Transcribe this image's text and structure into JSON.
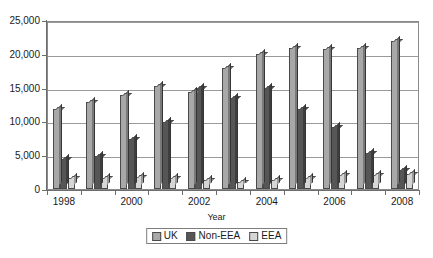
{
  "chart_data": {
    "type": "bar",
    "title": "",
    "xlabel": "Year",
    "ylabel": "",
    "categories": [
      "1998",
      "1999",
      "2000",
      "2001",
      "2002",
      "2003",
      "2004",
      "2005",
      "2006",
      "2007",
      "2008"
    ],
    "series": [
      {
        "name": "UK",
        "color": "#a8a8a8",
        "values": [
          11800,
          12800,
          13900,
          15200,
          14300,
          17900,
          19900,
          20900,
          20700,
          20900,
          21900
        ]
      },
      {
        "name": "Non-EEA",
        "color": "#565656",
        "values": [
          4400,
          4900,
          7400,
          9900,
          15000,
          13500,
          15000,
          11900,
          9100,
          5300,
          2800
        ]
      },
      {
        "name": "EEA",
        "color": "#d6d6d6",
        "values": [
          1700,
          1700,
          1800,
          1600,
          1300,
          1100,
          1300,
          1700,
          2000,
          2000,
          2200
        ]
      }
    ],
    "ylim": [
      0,
      25000
    ],
    "ytick_values": [
      0,
      5000,
      10000,
      15000,
      20000,
      25000
    ],
    "ytick_labels": [
      "0",
      "5,000",
      "10,000",
      "15,000",
      "20,000",
      "25,000"
    ],
    "xtick_labels": [
      "1998",
      "2000",
      "2002",
      "2004",
      "2006",
      "2008"
    ],
    "grid": true,
    "legend_position": "bottom"
  },
  "legend": {
    "items": [
      {
        "label": "UK",
        "color": "#a8a8a8"
      },
      {
        "label": "Non-EEA",
        "color": "#565656"
      },
      {
        "label": "EEA",
        "color": "#d6d6d6"
      }
    ]
  },
  "axis": {
    "x_title": "Year"
  }
}
